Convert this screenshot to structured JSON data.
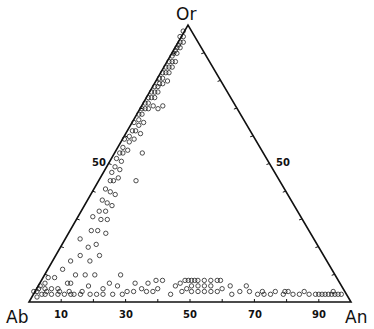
{
  "chart_data": {
    "type": "scatter",
    "subtype": "ternary",
    "title": "",
    "vertices": {
      "top": "Or",
      "left": "Ab",
      "right": "An"
    },
    "tick_labels": {
      "bottom": [
        "10",
        "30",
        "50",
        "70",
        "90"
      ],
      "left": [
        "50"
      ],
      "right": [
        "50"
      ]
    },
    "ticks_every": 10,
    "marker": "open-circle",
    "points_composition_note": "each point = [Ab, An, Or] in percent",
    "points": [
      [
        3,
        0,
        97
      ],
      [
        4,
        1,
        95
      ],
      [
        5,
        0,
        95
      ],
      [
        6,
        1,
        93
      ],
      [
        5,
        2,
        93
      ],
      [
        7,
        1,
        92
      ],
      [
        8,
        1,
        91
      ],
      [
        7,
        2,
        91
      ],
      [
        9,
        1,
        90
      ],
      [
        10,
        1,
        89
      ],
      [
        9,
        2,
        89
      ],
      [
        11,
        1,
        88
      ],
      [
        12,
        2,
        86
      ],
      [
        11,
        3,
        86
      ],
      [
        13,
        1,
        86
      ],
      [
        14,
        2,
        84
      ],
      [
        13,
        3,
        84
      ],
      [
        15,
        1,
        84
      ],
      [
        16,
        2,
        82
      ],
      [
        15,
        3,
        82
      ],
      [
        17,
        1,
        82
      ],
      [
        18,
        2,
        80
      ],
      [
        17,
        4,
        79
      ],
      [
        19,
        1,
        80
      ],
      [
        20,
        2,
        78
      ],
      [
        19,
        3,
        78
      ],
      [
        21,
        2,
        77
      ],
      [
        22,
        1,
        77
      ],
      [
        22,
        3,
        75
      ],
      [
        23,
        2,
        75
      ],
      [
        24,
        1,
        75
      ],
      [
        24,
        3,
        73
      ],
      [
        25,
        2,
        73
      ],
      [
        26,
        1,
        73
      ],
      [
        26,
        4,
        70
      ],
      [
        27,
        2,
        71
      ],
      [
        28,
        1,
        71
      ],
      [
        28,
        3,
        69
      ],
      [
        29,
        2,
        69
      ],
      [
        30,
        1,
        69
      ],
      [
        23,
        7,
        70
      ],
      [
        25,
        6,
        69
      ],
      [
        31,
        2,
        67
      ],
      [
        32,
        1,
        67
      ],
      [
        32,
        4,
        64
      ],
      [
        33,
        2,
        65
      ],
      [
        34,
        3,
        63
      ],
      [
        35,
        1,
        64
      ],
      [
        36,
        3,
        61
      ],
      [
        35,
        5,
        60
      ],
      [
        37,
        2,
        61
      ],
      [
        38,
        4,
        58
      ],
      [
        39,
        2,
        59
      ],
      [
        40,
        3,
        57
      ],
      [
        41,
        1,
        58
      ],
      [
        42,
        4,
        54
      ],
      [
        43,
        2,
        55
      ],
      [
        44,
        3,
        53
      ],
      [
        38,
        9,
        53
      ],
      [
        45,
        2,
        53
      ],
      [
        46,
        4,
        50
      ],
      [
        47,
        2,
        51
      ],
      [
        48,
        5,
        47
      ],
      [
        49,
        3,
        48
      ],
      [
        50,
        6,
        44
      ],
      [
        51,
        3,
        46
      ],
      [
        52,
        5,
        43
      ],
      [
        45,
        12,
        43
      ],
      [
        53,
        4,
        43
      ],
      [
        55,
        6,
        39
      ],
      [
        54,
        8,
        38
      ],
      [
        56,
        4,
        40
      ],
      [
        58,
        7,
        35
      ],
      [
        57,
        9,
        34
      ],
      [
        59,
        5,
        36
      ],
      [
        60,
        8,
        32
      ],
      [
        62,
        6,
        32
      ],
      [
        61,
        10,
        29
      ],
      [
        63,
        8,
        29
      ],
      [
        65,
        5,
        30
      ],
      [
        66,
        9,
        25
      ],
      [
        64,
        12,
        24
      ],
      [
        68,
        7,
        25
      ],
      [
        69,
        11,
        20
      ],
      [
        70,
        14,
        16
      ],
      [
        72,
        9,
        19
      ],
      [
        73,
        5,
        22
      ],
      [
        74,
        12,
        14
      ],
      [
        76,
        8,
        16
      ],
      [
        75,
        16,
        9
      ],
      [
        78,
        13,
        9
      ],
      [
        80,
        6,
        14
      ],
      [
        81,
        10,
        9
      ],
      [
        82,
        15,
        3
      ],
      [
        84,
        5,
        11
      ],
      [
        85,
        9,
        6
      ],
      [
        86,
        12,
        2
      ],
      [
        88,
        4,
        8
      ],
      [
        89,
        7,
        4
      ],
      [
        90,
        2,
        8
      ],
      [
        91,
        5,
        4
      ],
      [
        92,
        2,
        6
      ],
      [
        93,
        4,
        3
      ],
      [
        94,
        1,
        5
      ],
      [
        95,
        3,
        2
      ],
      [
        96,
        1,
        3
      ],
      [
        97,
        2,
        1
      ],
      [
        94,
        4,
        2
      ],
      [
        92,
        6,
        2
      ],
      [
        90,
        8,
        2
      ],
      [
        88,
        10,
        2
      ],
      [
        85,
        13,
        2
      ],
      [
        83,
        15,
        2
      ],
      [
        80,
        18,
        2
      ],
      [
        78,
        20,
        2
      ],
      [
        76,
        22,
        2
      ],
      [
        73,
        25,
        2
      ],
      [
        70,
        28,
        2
      ],
      [
        66,
        31,
        3
      ],
      [
        62,
        35,
        3
      ],
      [
        60,
        37,
        3
      ],
      [
        58,
        38,
        4
      ],
      [
        55,
        43,
        2
      ],
      [
        51,
        46,
        3
      ],
      [
        49,
        47,
        4
      ],
      [
        48,
        49,
        3
      ],
      [
        47,
        48,
        5
      ],
      [
        46,
        51,
        3
      ],
      [
        45,
        50,
        5
      ],
      [
        44,
        53,
        3
      ],
      [
        43,
        52,
        5
      ],
      [
        42,
        55,
        3
      ],
      [
        41,
        54,
        5
      ],
      [
        40,
        57,
        3
      ],
      [
        38,
        58,
        4
      ],
      [
        36,
        62,
        2
      ],
      [
        33,
        64,
        3
      ],
      [
        30,
        67,
        3
      ],
      [
        28,
        70,
        2
      ],
      [
        26,
        71,
        3
      ],
      [
        24,
        74,
        2
      ],
      [
        22,
        75,
        3
      ],
      [
        20,
        78,
        2
      ],
      [
        19,
        78,
        3
      ],
      [
        17,
        81,
        2
      ],
      [
        15,
        83,
        2
      ],
      [
        13,
        84,
        3
      ],
      [
        12,
        86,
        2
      ],
      [
        10,
        88,
        2
      ],
      [
        8,
        90,
        2
      ],
      [
        7,
        91,
        2
      ],
      [
        6,
        92,
        2
      ],
      [
        5,
        93,
        2
      ],
      [
        4,
        94,
        2
      ],
      [
        3,
        95,
        2
      ],
      [
        4,
        93,
        3
      ],
      [
        2,
        96,
        2
      ],
      [
        18,
        79,
        3
      ],
      [
        9,
        89,
        2
      ],
      [
        26,
        72,
        2
      ],
      [
        75,
        21,
        4
      ],
      [
        70,
        25,
        5
      ],
      [
        67,
        24,
        9
      ],
      [
        64,
        30,
        6
      ],
      [
        55,
        38,
        7
      ],
      [
        52,
        43,
        5
      ],
      [
        50,
        44,
        6
      ],
      [
        48,
        45,
        7
      ],
      [
        46,
        47,
        7
      ],
      [
        44,
        49,
        7
      ],
      [
        42,
        51,
        7
      ],
      [
        40,
        53,
        7
      ],
      [
        38,
        55,
        7
      ],
      [
        37,
        56,
        7
      ],
      [
        35,
        60,
        5
      ],
      [
        84,
        10,
        6
      ],
      [
        79,
        16,
        5
      ],
      [
        72,
        22,
        6
      ],
      [
        60,
        34,
        6
      ],
      [
        57,
        36,
        7
      ],
      [
        30,
        65,
        5
      ],
      [
        47,
        46,
        7
      ],
      [
        45,
        48,
        7
      ],
      [
        63,
        33,
        4
      ],
      [
        68,
        29,
        3
      ],
      [
        89,
        8,
        3
      ],
      [
        86,
        11,
        3
      ],
      [
        93,
        3,
        4
      ],
      [
        95,
        1,
        4
      ],
      [
        97,
        0,
        3
      ]
    ]
  }
}
